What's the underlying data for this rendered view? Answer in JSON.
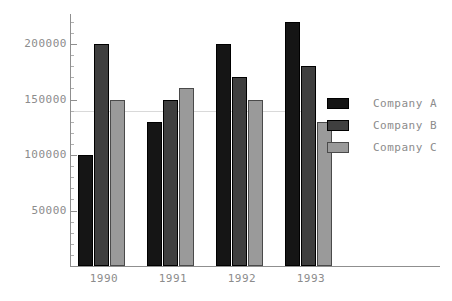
{
  "chart_data": {
    "type": "bar",
    "title": "",
    "xlabel": "",
    "ylabel": "",
    "categories": [
      "1990",
      "1991",
      "1992",
      "1993"
    ],
    "series": [
      {
        "name": "Company A",
        "color": "#151515",
        "values": [
          100000,
          130000,
          200000,
          220000
        ]
      },
      {
        "name": "Company B",
        "color": "#3f3f3f",
        "values": [
          200000,
          150000,
          170000,
          180000
        ]
      },
      {
        "name": "Company C",
        "color": "#9a9a9a",
        "values": [
          150000,
          160000,
          150000,
          130000
        ]
      }
    ],
    "ylim": [
      0,
      230000
    ],
    "ytick_labels": [
      "200000",
      "150000",
      "100000",
      "50000"
    ],
    "ytick_values": [
      200000,
      150000,
      100000,
      50000
    ],
    "yminor_step": 10000,
    "grid": true,
    "gridline_values": [
      140000
    ],
    "legend_position": "right",
    "axis_color": "#8f8f8f",
    "text_color": "#8c8c8c",
    "background": "#ffffff"
  },
  "legend": {
    "entries": [
      {
        "label": "Company A"
      },
      {
        "label": "Company B"
      },
      {
        "label": "Company C"
      }
    ]
  }
}
